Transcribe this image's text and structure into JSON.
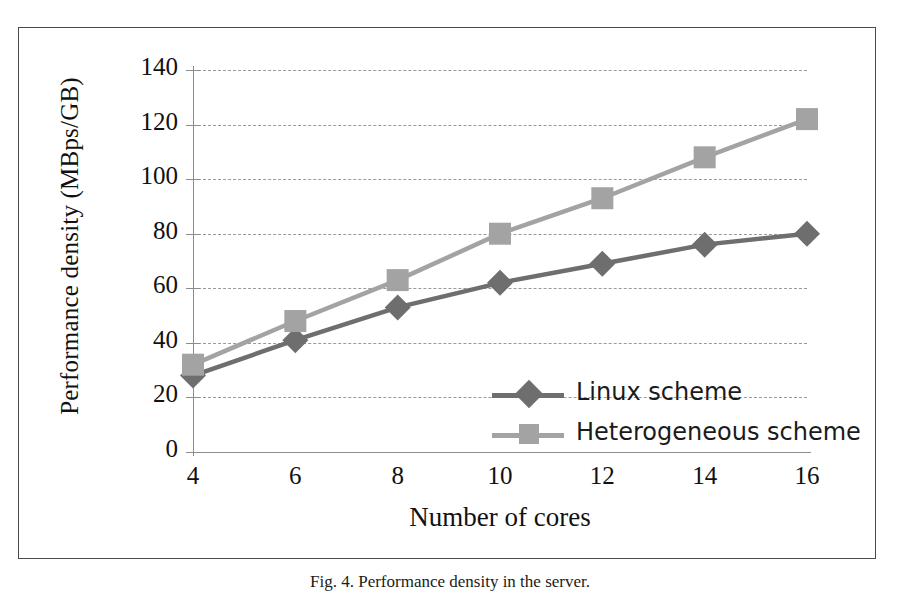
{
  "figure": {
    "caption": "Fig. 4.  Performance density in the server.",
    "frame_color": "#4a4a4a"
  },
  "chart_data": {
    "type": "line",
    "title": "",
    "xlabel": "Number of cores",
    "ylabel": "Performance density (MBps/GB)",
    "x": [
      4,
      6,
      8,
      10,
      12,
      14,
      16
    ],
    "xticklabels": [
      "4",
      "6",
      "8",
      "10",
      "12",
      "14",
      "16"
    ],
    "yticklabels": [
      "0",
      "20",
      "40",
      "60",
      "80",
      "100",
      "120",
      "140"
    ],
    "yticks": [
      0,
      20,
      40,
      60,
      80,
      100,
      120,
      140
    ],
    "xlim": [
      4,
      16
    ],
    "ylim": [
      0,
      140
    ],
    "grid": "horizontal-dashed",
    "legend_position": "inside-lower-right",
    "series": [
      {
        "name": "Linux scheme",
        "values": [
          28,
          41,
          53,
          62,
          69,
          76,
          80
        ],
        "color": "#6e6e6e",
        "marker": "diamond"
      },
      {
        "name": "Heterogeneous scheme",
        "values": [
          32,
          48,
          63,
          80,
          93,
          108,
          122
        ],
        "color": "#a3a3a3",
        "marker": "square"
      }
    ]
  }
}
